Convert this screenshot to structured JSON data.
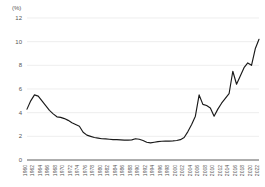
{
  "chart_data": {
    "type": "line",
    "title": "",
    "subtitle": "",
    "xlabel": "",
    "ylabel": "",
    "unit_label": "(%)",
    "ylim": [
      0,
      12
    ],
    "ytick_values": [
      0,
      2,
      4,
      6,
      8,
      10,
      12
    ],
    "ytick_labels": [
      "0",
      "2",
      "4",
      "6",
      "8",
      "10",
      "12"
    ],
    "grid": "horizontal",
    "legend": "none",
    "xlim": [
      1960,
      2022
    ],
    "xtick_labels": [
      "1960",
      "1962",
      "1964",
      "1966",
      "1968",
      "1970",
      "1972",
      "1974",
      "1976",
      "1978",
      "1980",
      "1982",
      "1984",
      "1986",
      "1988",
      "1990",
      "1992",
      "1994",
      "1996",
      "1998",
      "2000",
      "2002",
      "2004",
      "2006",
      "2008",
      "2010",
      "2012",
      "2014",
      "2016",
      "2018",
      "2020",
      "2022"
    ],
    "xtick_label_rotation_deg": 90,
    "line_color": "#1a1a1a",
    "grid_color": "#e3e3e3",
    "axis_color": "#4a4a4a",
    "background_color": "#ffffff",
    "x": [
      1960,
      1961,
      1962,
      1963,
      1964,
      1965,
      1966,
      1967,
      1968,
      1969,
      1970,
      1971,
      1972,
      1973,
      1974,
      1975,
      1976,
      1977,
      1978,
      1979,
      1980,
      1981,
      1982,
      1983,
      1984,
      1985,
      1986,
      1987,
      1988,
      1989,
      1990,
      1991,
      1992,
      1993,
      1994,
      1995,
      1996,
      1997,
      1998,
      1999,
      2000,
      2001,
      2002,
      2003,
      2004,
      2005,
      2006,
      2007,
      2008,
      2009,
      2010,
      2011,
      2012,
      2013,
      2014,
      2015,
      2016,
      2017,
      2018,
      2019,
      2020,
      2021,
      2022
    ],
    "values": [
      4.3,
      5.0,
      5.5,
      5.4,
      5.0,
      4.6,
      4.2,
      3.9,
      3.65,
      3.6,
      3.5,
      3.35,
      3.15,
      3.0,
      2.85,
      2.35,
      2.1,
      2.0,
      1.9,
      1.85,
      1.8,
      1.78,
      1.75,
      1.72,
      1.72,
      1.7,
      1.68,
      1.68,
      1.7,
      1.8,
      1.75,
      1.65,
      1.5,
      1.45,
      1.5,
      1.55,
      1.58,
      1.6,
      1.6,
      1.62,
      1.65,
      1.72,
      1.9,
      2.4,
      3.0,
      3.7,
      5.5,
      4.7,
      4.6,
      4.4,
      3.7,
      4.3,
      4.8,
      5.2,
      5.6,
      7.5,
      6.4,
      7.1,
      7.8,
      8.2,
      8.0,
      9.4,
      10.2
    ]
  }
}
